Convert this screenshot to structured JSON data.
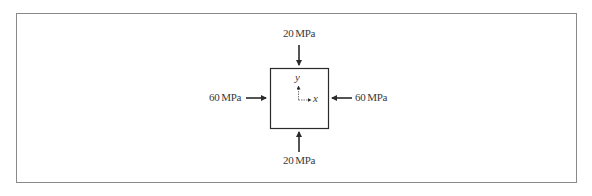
{
  "diagram": {
    "type": "stress-element",
    "loads": {
      "top": {
        "label": "20 MPa",
        "direction": "down",
        "value": 20,
        "unit": "MPa"
      },
      "bottom": {
        "label": "20 MPa",
        "direction": "up",
        "value": 20,
        "unit": "MPa"
      },
      "left": {
        "label": "60 MPa",
        "direction": "right",
        "value": 60,
        "unit": "MPa"
      },
      "right": {
        "label": "60 MPa",
        "direction": "left",
        "value": 60,
        "unit": "MPa"
      }
    },
    "axes": {
      "x_label": "x",
      "y_label": "y"
    },
    "colors": {
      "line": "#2a2a2a",
      "frame": "#8a8a8a",
      "text": "#3a3a3a"
    }
  }
}
